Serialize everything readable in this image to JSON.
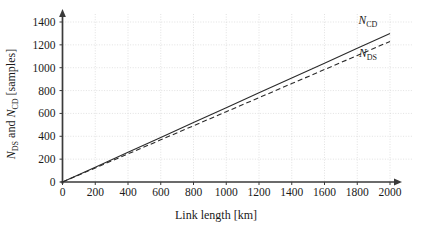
{
  "chart_data": {
    "type": "line",
    "title": "",
    "xlabel": "Link length [km]",
    "ylabel": "N_DS and N_CD [samples]",
    "ylabel_parts": {
      "lead": "N",
      "lead_sub": "DS",
      "middle": " and ",
      "second": "N",
      "second_sub": "CD",
      "tail": " [samples]"
    },
    "xlim": [
      0,
      2000
    ],
    "ylim": [
      0,
      1400
    ],
    "xticks": [
      0,
      200,
      400,
      600,
      800,
      1000,
      1200,
      1400,
      1600,
      1800,
      2000
    ],
    "yticks": [
      0,
      200,
      400,
      600,
      800,
      1000,
      1200,
      1400
    ],
    "xtick_labels": [
      "0",
      "200",
      "400",
      "600",
      "800",
      "1000",
      "1200",
      "1400",
      "1600",
      "1800",
      "2000"
    ],
    "ytick_labels": [
      "0",
      "200",
      "400",
      "600",
      "800",
      "1000",
      "1200",
      "1400"
    ],
    "grid": true,
    "legend_position": "inline-right",
    "x": [
      0,
      200,
      400,
      600,
      800,
      1000,
      1200,
      1400,
      1600,
      1800,
      2000
    ],
    "series": [
      {
        "name": "N_CD",
        "label_main": "N",
        "label_sub": "CD",
        "style": "solid",
        "color": "#2b2b2b",
        "values": [
          0,
          130,
          260,
          390,
          520,
          650,
          780,
          910,
          1040,
          1170,
          1300
        ]
      },
      {
        "name": "N_DS",
        "label_main": "N",
        "label_sub": "DS",
        "style": "dashed",
        "color": "#2b2b2b",
        "values": [
          0,
          123,
          246,
          369,
          492,
          615,
          738,
          861,
          984,
          1107,
          1230
        ]
      }
    ],
    "colors": {
      "axis": "#3a3a3a",
      "grid": "#cfcfcf",
      "line": "#2b2b2b",
      "background": "#ffffff"
    }
  }
}
